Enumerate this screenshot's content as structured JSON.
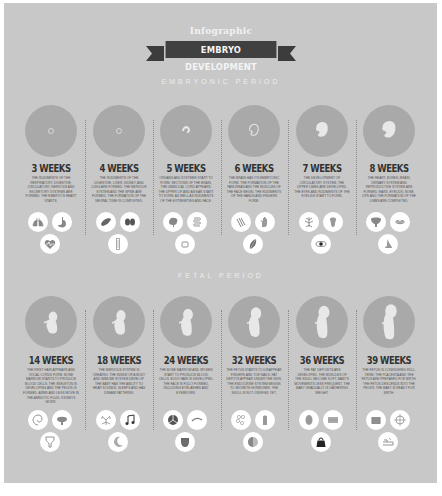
{
  "header": {
    "pretitle": "Infographic",
    "title": "EMBRYO DEVELOPMENT"
  },
  "colors": {
    "background": "#c8c8c8",
    "circle": "#a9a9a9",
    "ribbon": "#404040",
    "icon_bg": "#ffffff",
    "icon_fg": "#8a8a8a"
  },
  "sections": [
    {
      "title": "EMBRYONIC PERIOD",
      "stages": [
        {
          "week": "3 WEEKS",
          "description": "The rudiments of the respiratory, digestive, circulatory, nervous and excretory systems are formed. The embryo's heart starts.",
          "embryo": "dot",
          "icons": [
            "lungs-icon",
            "stomach-icon",
            "heart-pulse-icon"
          ]
        },
        {
          "week": "4 WEEKS",
          "description": "The rudiments of the digestive, liver, kidney, and lung are formed. The nervous system and the spine are formed. The formation of the neural tube is completed.",
          "embryo": "dot",
          "icons": [
            "liver-icon",
            "kidneys-icon",
            "spine-icon"
          ]
        },
        {
          "week": "5 WEEKS",
          "description": "Organs and systems start to form. Sections of the brain, the umbilical cord appears. The upper lip and an ear start to form, as well as rudiments of the extremities and face.",
          "embryo": "curl",
          "icons": [
            "brain-icon",
            "intestine-icon",
            "mouth-icon"
          ]
        },
        {
          "week": "6 WEEKS",
          "description": "The brain has its embryonic form. The formation of the pancreas and the muscles of the face begin. The rudiments of the hands and fingers form.",
          "embryo": "small",
          "icons": [
            "muscles-icon",
            "hand-icon",
            "pancreas-icon"
          ]
        },
        {
          "week": "7 WEEKS",
          "description": "The development of circulatory system, the upper limbs are developed. The eyes and rudiments of the eyelids start to form.",
          "embryo": "medium",
          "icons": [
            "veins-icon",
            "tooth-icon",
            "eye-icon"
          ]
        },
        {
          "week": "8 WEEKS",
          "description": "The heart, bones, brain, urinary system and reproductive system are formed. Ears, eyelids, nose, lips and the formation of the limbs are completed.",
          "embryo": "large",
          "icons": [
            "bladder-icon",
            "lips-icon",
            "nose-icon"
          ]
        }
      ]
    },
    {
      "title": "FETAL PERIOD",
      "stages": [
        {
          "week": "14 WEEKS",
          "description": "The first hair appears and vocal cords form. Bone marrow starts to produce blood cells. The skeleton is developing and the pelvis is formed. Arms and legs move in the amniotic fluid. Kidneys work.",
          "embryo": "fetus-1",
          "icons": [
            "ear-icon",
            "lungs-tree-icon",
            "pelvis-icon"
          ]
        },
        {
          "week": "18 WEEKS",
          "description": "The nervous system is created. The inside of a body and immune system develop. The baby has the ability to hear sounds, sleeps and has dream patterns.",
          "embryo": "fetus-2",
          "icons": [
            "nerves-icon",
            "music-note-icon",
            "moon-icon"
          ]
        },
        {
          "week": "24 WEEKS",
          "description": "The bone marrow and spleen start to produce blood cells. Body hair is developed. The face is fully formed, including eyelashes and eyebrows.",
          "embryo": "fetus-3",
          "icons": [
            "spleen-icon",
            "eyebrow-icon",
            "liver-shield-icon"
          ]
        },
        {
          "week": "32 WEEKS",
          "description": "The fetus starts to disappear fingers and toe nails. Fat depots appear under the skin. The endocrine system begins to secrete hormones. The skull is not ossified yet.",
          "embryo": "fetus-4",
          "icons": [
            "molecule-icon",
            "finger-icon",
            "skull-icon"
          ]
        },
        {
          "week": "36 WEEKS",
          "description": "The fat deposits are developed. The muscles of the skull become soft. Baby's movements less frequent. The baby gradually is gathering weight.",
          "embryo": "fetus-5",
          "icons": [
            "kidney-icon",
            "skin-icon",
            "weight-icon"
          ]
        },
        {
          "week": "39 WEEKS",
          "description": "The fetus is considered full-term. The placenta and the fetus are prepared for birth. The fetus descends into the pelvis. The baby is ready for birth.",
          "embryo": "fetus-6",
          "icons": [
            "placenta-icon",
            "target-icon",
            "bed-icon"
          ]
        }
      ]
    }
  ]
}
